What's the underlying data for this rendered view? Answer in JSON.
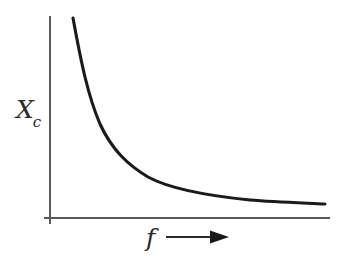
{
  "figure": {
    "title": "",
    "background_color": "#ffffff",
    "curve_color": "#1a1a1a",
    "axis_color": "#5a5a5a",
    "label_color": "#2b2b2b"
  },
  "axes": {
    "y_label_main": "X",
    "y_label_sub": "c",
    "y_label_full": "Xc",
    "x_label": "f",
    "x_arrow_icon": "right-arrow-icon",
    "origin": {
      "x": 50,
      "y": 218
    },
    "y_axis_top": 16,
    "y_axis_bottom": 224,
    "x_axis_left": 44,
    "x_axis_right": 330
  },
  "chart_data": {
    "type": "line",
    "title": "",
    "xlabel": "f",
    "ylabel": "Xc",
    "grid": false,
    "legend": null,
    "axis_ticks": {
      "x": [],
      "y": []
    },
    "annotations": [
      {
        "text": "f",
        "role": "x-axis-label"
      },
      {
        "text": "Xc",
        "role": "y-axis-label"
      },
      {
        "text": "→",
        "role": "x-axis-direction-arrow"
      }
    ],
    "xlim": [
      0,
      1
    ],
    "ylim": [
      0,
      1
    ],
    "x": [
      0.08,
      0.1,
      0.12,
      0.15,
      0.18,
      0.22,
      0.26,
      0.31,
      0.37,
      0.44,
      0.52,
      0.61,
      0.71,
      0.82,
      0.94,
      1.0
    ],
    "y": [
      1.0,
      0.8,
      0.66,
      0.53,
      0.44,
      0.36,
      0.3,
      0.26,
      0.22,
      0.19,
      0.165,
      0.145,
      0.13,
      0.118,
      0.108,
      0.105
    ],
    "series": [
      {
        "name": "Xc vs f",
        "values": [
          1.0,
          0.8,
          0.66,
          0.53,
          0.44,
          0.36,
          0.3,
          0.26,
          0.22,
          0.19,
          0.165,
          0.145,
          0.13,
          0.118,
          0.108,
          0.105
        ]
      }
    ],
    "curve_path": "M 73 18 C 81 62, 88 96, 100 124 C 112 150, 128 165, 148 177 C 172 190, 210 196, 250 200 C 275 202, 305 203, 325 204"
  }
}
